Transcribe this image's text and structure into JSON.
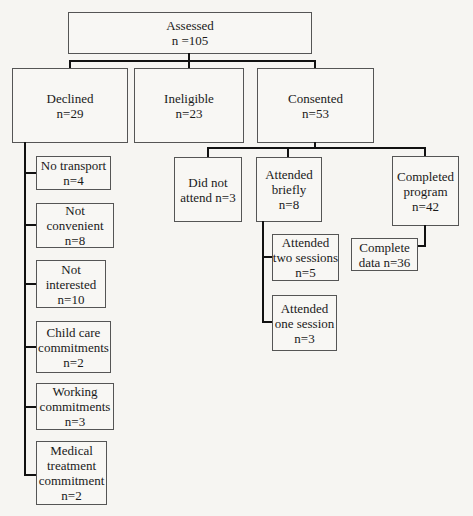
{
  "diagram": {
    "type": "participant flow chart",
    "root": {
      "label": "Assessed",
      "count": "n =105"
    },
    "level1": [
      {
        "label": "Declined",
        "count": "n=29"
      },
      {
        "label": "Ineligible",
        "count": "n=23"
      },
      {
        "label": "Consented",
        "count": "n=53"
      }
    ],
    "declined_reasons": [
      {
        "lines": [
          "No transport",
          "n=4"
        ]
      },
      {
        "lines": [
          "Not",
          "convenient",
          "n=8"
        ]
      },
      {
        "lines": [
          "Not",
          "interested",
          "n=10"
        ]
      },
      {
        "lines": [
          "Child care",
          "commitments",
          "n=2"
        ]
      },
      {
        "lines": [
          "Working",
          "commitments",
          "n=3"
        ]
      },
      {
        "lines": [
          "Medical",
          "treatment",
          "commitment",
          "n=2"
        ]
      }
    ],
    "consented_outcomes": [
      {
        "lines": [
          "Did not",
          "attend n=3"
        ]
      },
      {
        "lines": [
          "Attended",
          "briefly",
          "n=8"
        ]
      },
      {
        "lines": [
          "Completed",
          "program",
          "n=42"
        ]
      }
    ],
    "attended_briefly_detail": [
      {
        "lines": [
          "Attended",
          "two sessions",
          "n=5"
        ]
      },
      {
        "lines": [
          "Attended",
          "one session",
          "n=3"
        ]
      }
    ],
    "completed_detail": [
      {
        "lines": [
          "Complete",
          "data n=36"
        ]
      }
    ]
  }
}
